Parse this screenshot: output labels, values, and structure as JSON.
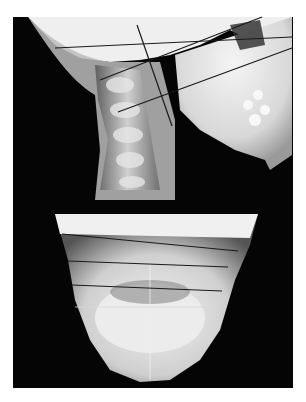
{
  "figure": {
    "panels": [
      {
        "id": "lateral",
        "description": "Lateral cephalometric radiograph with cervical spine and jaw, overlaid with reference lines"
      },
      {
        "id": "frontal",
        "description": "Posteroanterior (submentovertex-like) radiograph of mandible with horizontal reference lines"
      }
    ],
    "colors": {
      "background": "#ffffff",
      "film": "#050505",
      "bone": "#e8e8e8",
      "line": "#1a1a1a"
    }
  }
}
